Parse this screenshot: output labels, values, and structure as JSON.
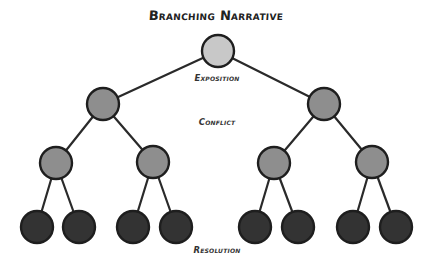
{
  "diagram": {
    "title": "Branching Narrative",
    "type": "tree",
    "colors": {
      "root_fill": "#c8c8c8",
      "branch_fill": "#8e8e8e",
      "leaf_fill": "#333333",
      "stroke": "#1e1e1e",
      "edge": "#2a2a2a"
    },
    "stage_labels": [
      {
        "id": "exposition",
        "text": "Exposition",
        "x": 217,
        "y": 79
      },
      {
        "id": "conflict",
        "text": "Conflict",
        "x": 217,
        "y": 123
      },
      {
        "id": "resolution",
        "text": "Resolution",
        "x": 217,
        "y": 251
      }
    ],
    "nodes": [
      {
        "id": "n0",
        "level": 0,
        "x": 218,
        "y": 51,
        "r": 16,
        "fill": "#c8c8c8"
      },
      {
        "id": "n1",
        "level": 1,
        "x": 103,
        "y": 104,
        "r": 16,
        "fill": "#8e8e8e"
      },
      {
        "id": "n2",
        "level": 1,
        "x": 324,
        "y": 104,
        "r": 16,
        "fill": "#8e8e8e"
      },
      {
        "id": "n3",
        "level": 2,
        "x": 56,
        "y": 163,
        "r": 16,
        "fill": "#8e8e8e"
      },
      {
        "id": "n4",
        "level": 2,
        "x": 153,
        "y": 162,
        "r": 16,
        "fill": "#8e8e8e"
      },
      {
        "id": "n5",
        "level": 2,
        "x": 274,
        "y": 163,
        "r": 16,
        "fill": "#8e8e8e"
      },
      {
        "id": "n6",
        "level": 2,
        "x": 372,
        "y": 162,
        "r": 16,
        "fill": "#8e8e8e"
      },
      {
        "id": "n7",
        "level": 3,
        "x": 37,
        "y": 227,
        "r": 16,
        "fill": "#333333"
      },
      {
        "id": "n8",
        "level": 3,
        "x": 79,
        "y": 227,
        "r": 16,
        "fill": "#333333"
      },
      {
        "id": "n9",
        "level": 3,
        "x": 133,
        "y": 227,
        "r": 16,
        "fill": "#333333"
      },
      {
        "id": "n10",
        "level": 3,
        "x": 176,
        "y": 227,
        "r": 16,
        "fill": "#333333"
      },
      {
        "id": "n11",
        "level": 3,
        "x": 255,
        "y": 227,
        "r": 16,
        "fill": "#333333"
      },
      {
        "id": "n12",
        "level": 3,
        "x": 298,
        "y": 227,
        "r": 16,
        "fill": "#333333"
      },
      {
        "id": "n13",
        "level": 3,
        "x": 353,
        "y": 227,
        "r": 16,
        "fill": "#333333"
      },
      {
        "id": "n14",
        "level": 3,
        "x": 396,
        "y": 227,
        "r": 16,
        "fill": "#333333"
      }
    ],
    "edges": [
      [
        "n0",
        "n1"
      ],
      [
        "n0",
        "n2"
      ],
      [
        "n1",
        "n3"
      ],
      [
        "n1",
        "n4"
      ],
      [
        "n2",
        "n5"
      ],
      [
        "n2",
        "n6"
      ],
      [
        "n3",
        "n7"
      ],
      [
        "n3",
        "n8"
      ],
      [
        "n4",
        "n9"
      ],
      [
        "n4",
        "n10"
      ],
      [
        "n5",
        "n11"
      ],
      [
        "n5",
        "n12"
      ],
      [
        "n6",
        "n13"
      ],
      [
        "n6",
        "n14"
      ]
    ]
  }
}
